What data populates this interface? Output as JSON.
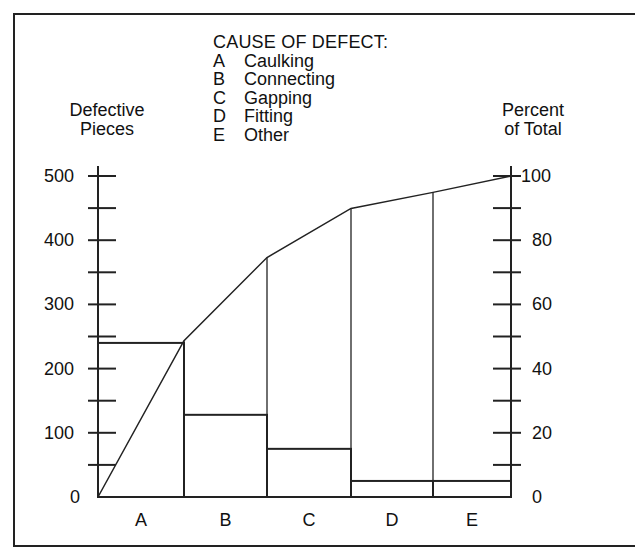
{
  "chart_data": {
    "type": "bar",
    "subtype": "pareto",
    "title": "CAUSE OF DEFECT:",
    "legend": [
      {
        "code": "A",
        "label": "Caulking"
      },
      {
        "code": "B",
        "label": "Connecting"
      },
      {
        "code": "C",
        "label": "Gapping"
      },
      {
        "code": "D",
        "label": "Fitting"
      },
      {
        "code": "E",
        "label": "Other"
      }
    ],
    "categories": [
      "A",
      "B",
      "C",
      "D",
      "E"
    ],
    "series": [
      {
        "name": "Defective Pieces",
        "axis": "left",
        "type": "bar",
        "values": [
          240,
          128,
          75,
          25,
          25
        ]
      },
      {
        "name": "Cumulative Percent of Total",
        "axis": "right",
        "type": "line",
        "values": [
          48.7,
          74.6,
          89.9,
          94.9,
          100
        ]
      }
    ],
    "ylabel_left": "Defective Pieces",
    "ylabel_right": "Percent of Total",
    "ylim_left": [
      0,
      500
    ],
    "ylim_right": [
      0,
      100
    ],
    "yticks_left": [
      "0",
      "100",
      "200",
      "300",
      "400",
      "500"
    ],
    "yticks_right": [
      "0",
      "20",
      "40",
      "60",
      "80",
      "100"
    ],
    "grid": false
  },
  "labels": {
    "legend_title": "CAUSE OF DEFECT:",
    "left_axis_title_line1": "Defective",
    "left_axis_title_line2": "Pieces",
    "right_axis_title_line1": "Percent",
    "right_axis_title_line2": "of Total"
  }
}
